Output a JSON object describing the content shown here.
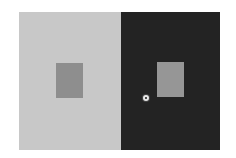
{
  "illusion": {
    "name": "simultaneous-contrast",
    "colors": {
      "page_background": "#ffffff",
      "left_panel": "#c8c8c8",
      "right_panel": "#232323",
      "left_square": "#8e8e8e",
      "right_square": "#969696"
    }
  },
  "cursor": {
    "x": 146,
    "y": 98
  }
}
